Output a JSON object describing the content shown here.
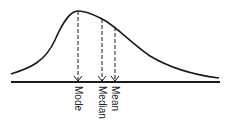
{
  "diagram": {
    "labels": {
      "mode": "Mode",
      "median": "Median",
      "mean": "Mean"
    },
    "colors": {
      "stroke": "#1a1a1a",
      "background": "#ffffff"
    }
  }
}
